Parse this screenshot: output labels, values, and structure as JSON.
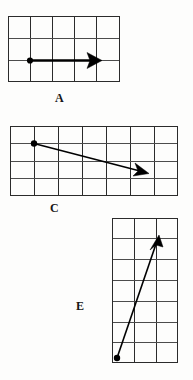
{
  "figure": {
    "title": "",
    "background_color": "#fdfdfc",
    "ink_color": "#000000",
    "grid_color": "#4c4c4c",
    "panels": [
      {
        "id": "A",
        "label": "A",
        "label_text": "A",
        "grid": {
          "columns": 5,
          "rows": 3,
          "cell_size_px": 22,
          "origin_x_px": 8,
          "origin_y_px": 16,
          "width_px": 112,
          "height_px": 66
        },
        "vector": {
          "name": "arrow-a",
          "direction": "right",
          "start_cell": [
            1,
            2
          ],
          "end_cell": [
            4,
            2
          ],
          "length_cells": 3,
          "has_tail_dot": true,
          "has_arrow_head": true,
          "description": "horizontal vector pointing right, 3 units long"
        }
      },
      {
        "id": "C",
        "label": "C",
        "label_text": "C",
        "grid": {
          "columns": 7,
          "rows": 4,
          "cell_size_px": 24,
          "origin_x_px": 10,
          "origin_y_px": 126,
          "width_px": 168,
          "height_px": 70
        },
        "vector": {
          "name": "arrow-c",
          "direction": "right-down",
          "start_cell": [
            1,
            1
          ],
          "end_cell": [
            5.6,
            2.1
          ],
          "length_cells": 4.7,
          "has_tail_dot": true,
          "has_arrow_head": true,
          "description": "vector pointing right and slightly downward"
        }
      },
      {
        "id": "E",
        "label": "E",
        "label_text": "E",
        "grid": {
          "columns": 3,
          "rows": 7,
          "cell_size_px": 22,
          "origin_x_px": 112,
          "origin_y_px": 218,
          "width_px": 66,
          "height_px": 145
        },
        "vector": {
          "name": "arrow-e",
          "direction": "right-up",
          "start_cell": [
            0.1,
            6.8
          ],
          "end_cell": [
            2.0,
            0.9
          ],
          "length_cells": 6.2,
          "has_tail_dot": true,
          "has_arrow_head": true,
          "description": "steep vector pointing up and to the right"
        }
      }
    ]
  }
}
